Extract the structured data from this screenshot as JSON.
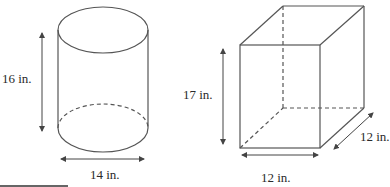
{
  "colors": {
    "stroke": "#555555",
    "text": "#2a2a2a",
    "background": "#ffffff"
  },
  "cylinder": {
    "shape": "cylinder",
    "height_label": "16 in.",
    "diameter_label": "14 in."
  },
  "box": {
    "shape": "rectangular-prism",
    "height_label": "17 in.",
    "width_label": "12 in.",
    "depth_label": "12 in."
  }
}
